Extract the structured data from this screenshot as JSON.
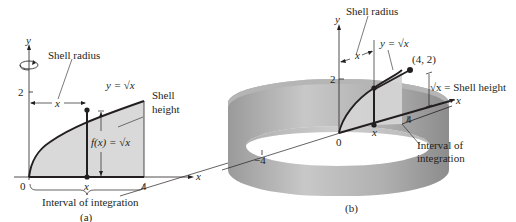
{
  "panel_a": {
    "caption": "(a)",
    "y_axis_label": "y",
    "x_axis_label": "x",
    "tick_y_2": "2",
    "tick_origin": "0",
    "tick_x": "x",
    "tick_4": "4",
    "shell_radius_label": "Shell radius",
    "radius_var": "x",
    "curve_label": "y = √x",
    "shell_height_label_1": "Shell",
    "shell_height_label_2": "height",
    "height_formula": "f(x) = √x",
    "interval_label": "Interval of integration",
    "icons": {
      "rotation": "rotation-arrow-icon"
    }
  },
  "panel_b": {
    "caption": "(b)",
    "y_axis_label": "y",
    "x_axis_label": "x",
    "tick_y_2": "2",
    "tick_origin": "0",
    "tick_x": "x",
    "tick_4": "4",
    "tick_neg4": "−4",
    "shell_radius_label": "Shell radius",
    "radius_var": "x",
    "curve_label": "y = √x",
    "point_label": "(4, 2)",
    "shell_height_label": "√x = Shell height",
    "interval_label_1": "Interval of",
    "interval_label_2": "integration"
  },
  "colors": {
    "fill_region": "#d9d9d9",
    "shell_outer": "#a6a6a6",
    "line": "#231f20"
  }
}
